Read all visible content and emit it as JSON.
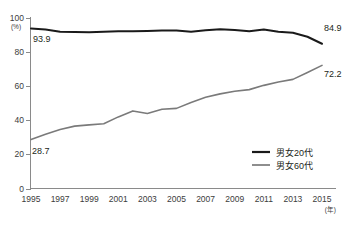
{
  "chart_data": {
    "type": "line",
    "title": "",
    "subtitle": "",
    "xlabel": "(年)",
    "ylabel": "(%)",
    "ylim": [
      0,
      100
    ],
    "xlim": [
      1995,
      2015
    ],
    "yticks": [
      "0",
      "20",
      "40",
      "60",
      "80",
      "100"
    ],
    "ytick_values": [
      0,
      20,
      40,
      60,
      80,
      100
    ],
    "xticks": [
      "1995",
      "1997",
      "1999",
      "2001",
      "2003",
      "2005",
      "2007",
      "2009",
      "2011",
      "2013",
      "2015"
    ],
    "xtick_values": [
      1995,
      1997,
      1999,
      2001,
      2003,
      2005,
      2007,
      2009,
      2011,
      2013,
      2015
    ],
    "grid": false,
    "legend_position": "bottom-right",
    "x": [
      1995,
      1996,
      1997,
      1998,
      1999,
      2000,
      2001,
      2002,
      2003,
      2004,
      2005,
      2006,
      2007,
      2008,
      2009,
      2010,
      2011,
      2012,
      2013,
      2014,
      2015
    ],
    "series": [
      {
        "name": "男女20代",
        "color": "#1a1a1a",
        "values": [
          93.9,
          93.2,
          92.0,
          91.8,
          91.6,
          92.0,
          92.3,
          92.3,
          92.4,
          92.6,
          92.6,
          92.0,
          92.8,
          93.4,
          93.0,
          92.2,
          93.3,
          92.0,
          91.3,
          89.0,
          84.9
        ],
        "start_label": "93.9",
        "end_label": "84.9"
      },
      {
        "name": "男女60代",
        "color": "#7a7a7a",
        "values": [
          28.7,
          31.8,
          34.6,
          36.6,
          37.3,
          38.0,
          42.0,
          45.5,
          44.0,
          46.5,
          47.0,
          50.5,
          53.5,
          55.5,
          57.0,
          58.0,
          60.5,
          62.5,
          64.0,
          68.0,
          72.2
        ],
        "start_label": "28.7",
        "end_label": "72.2"
      }
    ],
    "annotations": [
      {
        "text": "93.9",
        "series": "男女20代",
        "position": "start"
      },
      {
        "text": "84.9",
        "series": "男女20代",
        "position": "end"
      },
      {
        "text": "28.7",
        "series": "男女60代",
        "position": "start"
      },
      {
        "text": "72.2",
        "series": "男女60代",
        "position": "end"
      }
    ]
  },
  "legend": {
    "items": [
      {
        "label": "男女20代",
        "color": "#1a1a1a"
      },
      {
        "label": "男女60代",
        "color": "#7a7a7a"
      }
    ]
  },
  "axis": {
    "y_unit": "(%)",
    "x_unit": "(年)"
  }
}
